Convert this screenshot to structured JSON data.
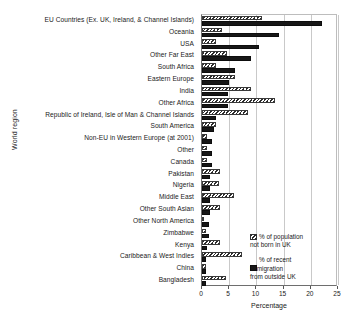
{
  "chart_data": {
    "type": "bar",
    "orientation": "horizontal",
    "title": "",
    "xlabel": "Percentage",
    "ylabel": "World region",
    "xlim": [
      0,
      25
    ],
    "xticks": [
      0,
      5,
      10,
      15,
      20,
      25
    ],
    "grid": true,
    "legend_position": "inside-bottom-right",
    "categories": [
      "EU Countries (Ex. UK, Ireland, & Channel Islands)",
      "Oceania",
      "USA",
      "Other Far East",
      "South Africa",
      "Eastern Europe",
      "India",
      "Other Africa",
      "Republic of Ireland, Isle of Man & Channel Islands",
      "South America",
      "Non-EU in Western Europe (at 2001)",
      "Other",
      "Canada",
      "Pakistan",
      "Nigeria",
      "Middle East",
      "Other South Asian",
      "Other North America",
      "Zimbabwe",
      "Kenya",
      "Caribbean & West Indies",
      "China",
      "Bangladesh"
    ],
    "series": [
      {
        "name": "% of population not born in UK",
        "style": "hatched",
        "values": [
          11.0,
          3.6,
          2.5,
          4.6,
          2.5,
          6.0,
          9.0,
          13.5,
          8.5,
          2.6,
          0.9,
          0.9,
          0.9,
          3.3,
          3.2,
          5.8,
          3.4,
          0.2,
          0.8,
          3.3,
          7.3,
          0.7,
          4.4
        ]
      },
      {
        "name": "% of recent immigration from outside UK",
        "style": "solid",
        "values": [
          22.1,
          14.2,
          10.4,
          9.0,
          6.0,
          5.0,
          4.7,
          4.7,
          2.5,
          2.2,
          1.9,
          1.8,
          1.8,
          1.5,
          1.4,
          1.4,
          1.4,
          1.3,
          1.2,
          0.9,
          0.8,
          0.8,
          0.7
        ]
      }
    ],
    "legend": [
      {
        "label": "% of population\nnot born in UK",
        "style": "hatched"
      },
      {
        "label": "% of recent\nimmigration\nfrom outside UK",
        "style": "solid"
      }
    ],
    "colors": {
      "solid_bar": "#171717",
      "hatch_line": "#2b2b2b",
      "grid": "#c9c9c9",
      "axis": "#6e6e6e",
      "text": "#1a1a1a"
    }
  }
}
